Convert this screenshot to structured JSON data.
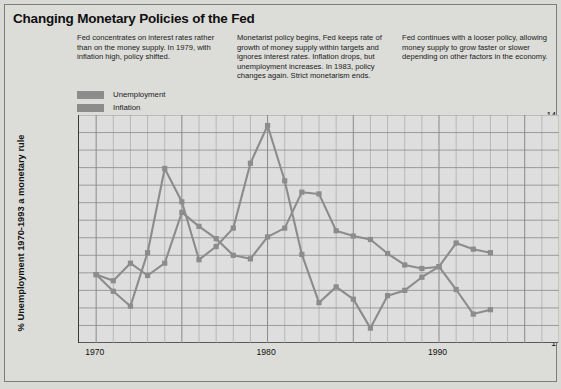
{
  "title": "Changing Monetary Policies of the Fed",
  "notes": [
    "Fed concentrates on interest rates rather than on the money supply. In 1979, with inflation high, policy shifted.",
    "Monetarist policy begins, Fed keeps rate of growth of money supply within targets and ignores interest rates. Inflation drops, but unemployment increases. In 1983, policy changes again. Strict monetarism ends.",
    "Fed continues with a looser policy, allowing money supply to grow faster or slower depending on other factors in the economy."
  ],
  "legend": [
    {
      "label": "Unemployment",
      "color": "#8c8c8c"
    },
    {
      "label": "Inflation",
      "color": "#8c8c8c"
    }
  ],
  "colors": {
    "series": "#8c8c8c",
    "plot_background": "#dedede",
    "grid": "#9a9a9a",
    "axis": "#3a3a3a",
    "page_background": "#dcdcd8"
  },
  "chart_data": {
    "type": "line",
    "title": "Changing Monetary Policies of the Fed",
    "xlabel": "",
    "ylabel": "% Unemployment 1970-1993 a monetary rule",
    "xlim": [
      1969,
      1997
    ],
    "ylim": [
      1,
      14
    ],
    "yticks": [
      1,
      2,
      3,
      4,
      5,
      6,
      7,
      8,
      9,
      10,
      11,
      12,
      13,
      14
    ],
    "xticks": [
      1970,
      1980,
      1990
    ],
    "xtick_labels": [
      "1970",
      "1980",
      "1990"
    ],
    "grid": true,
    "legend_position": "top-left",
    "markers": "square",
    "x": [
      1970,
      1971,
      1972,
      1973,
      1974,
      1975,
      1976,
      1977,
      1978,
      1979,
      1980,
      1981,
      1982,
      1983,
      1984,
      1985,
      1986,
      1987,
      1988,
      1989,
      1990,
      1991,
      1992,
      1993
    ],
    "series": [
      {
        "name": "Unemployment",
        "values": [
          4.9,
          4.55,
          5.55,
          4.85,
          5.55,
          8.45,
          7.65,
          6.95,
          6.0,
          5.8,
          7.05,
          7.55,
          9.6,
          9.5,
          7.4,
          7.1,
          6.9,
          6.1,
          5.45,
          5.25,
          5.35,
          6.7,
          6.35,
          6.15
        ]
      },
      {
        "name": "Inflation",
        "values": [
          4.9,
          3.95,
          3.1,
          6.15,
          10.95,
          9.05,
          5.75,
          6.5,
          7.55,
          11.25,
          13.4,
          10.25,
          6.05,
          3.3,
          4.2,
          3.5,
          1.85,
          3.7,
          4.0,
          4.75,
          5.35,
          4.05,
          2.65,
          2.9
        ]
      }
    ]
  }
}
